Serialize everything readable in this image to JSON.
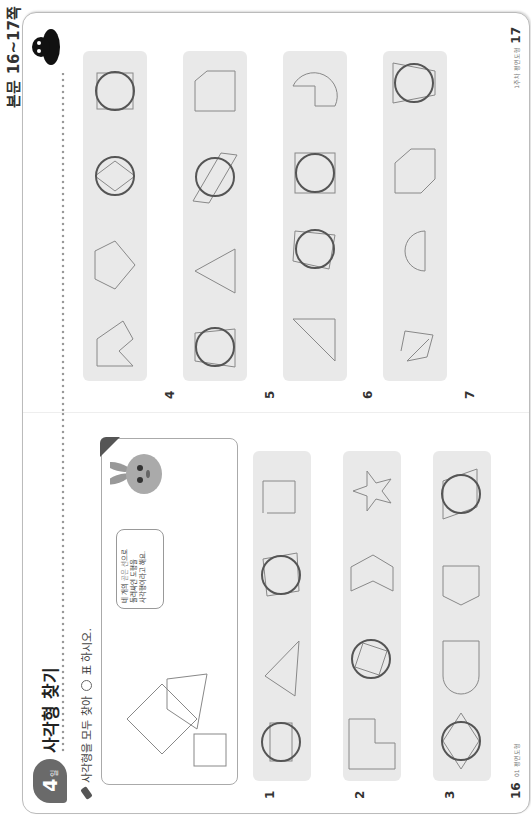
{
  "header": {
    "label": "본문 16~17쪽"
  },
  "left_page": {
    "day_badge": {
      "number": "4",
      "suffix": "일"
    },
    "title": "사각형 찾기",
    "instruction": {
      "before": "사각형을 모두 찾아",
      "after": "표 하시오."
    },
    "example": {
      "shapes": [
        "rhombus",
        "trapezoid",
        "square"
      ],
      "speech_bubble": {
        "line1_prefix": "네 개의 ",
        "line1_highlight": "곧은 선",
        "line1_suffix": "으로",
        "line2": "둘러싸인 도형을",
        "line3": "사각형이라고 해요."
      },
      "character": "bunny"
    },
    "problems": [
      {
        "number": "1",
        "shapes": [
          {
            "type": "rectangle",
            "circled": true
          },
          {
            "type": "triangle",
            "circled": false
          },
          {
            "type": "tilted-rectangle",
            "circled": true
          },
          {
            "type": "open-rectangle",
            "circled": false
          }
        ]
      },
      {
        "number": "2",
        "shapes": [
          {
            "type": "L-hexagon",
            "circled": false
          },
          {
            "type": "rotated-square",
            "circled": true
          },
          {
            "type": "chevron",
            "circled": false
          },
          {
            "type": "star",
            "circled": false
          }
        ]
      },
      {
        "number": "3",
        "shapes": [
          {
            "type": "rhombus",
            "circled": true
          },
          {
            "type": "semicircle",
            "circled": false
          },
          {
            "type": "pentagon",
            "circled": false
          },
          {
            "type": "parallelogram",
            "circled": true
          }
        ]
      }
    ],
    "page_number": "16",
    "page_tag": "01 평면도형"
  },
  "right_page": {
    "problems": [
      {
        "number": "4",
        "shapes": [
          {
            "type": "arrow-pentagon",
            "circled": false
          },
          {
            "type": "pentagon",
            "circled": false
          },
          {
            "type": "kite",
            "circled": true
          },
          {
            "type": "square",
            "circled": true
          }
        ]
      },
      {
        "number": "5",
        "shapes": [
          {
            "type": "trapezoid",
            "circled": true
          },
          {
            "type": "triangle",
            "circled": false
          },
          {
            "type": "parallelogram",
            "circled": true
          },
          {
            "type": "cut-rectangle",
            "circled": false
          }
        ]
      },
      {
        "number": "6",
        "shapes": [
          {
            "type": "right-triangle",
            "circled": false
          },
          {
            "type": "quadrilateral",
            "circled": true
          },
          {
            "type": "rectangle",
            "circled": true
          },
          {
            "type": "pacman-circle",
            "circled": false
          }
        ]
      },
      {
        "number": "7",
        "shapes": [
          {
            "type": "open-quadrilateral",
            "circled": false
          },
          {
            "type": "semicircle",
            "circled": false
          },
          {
            "type": "hexagon",
            "circled": false
          },
          {
            "type": "trapezoid",
            "circled": true
          }
        ]
      }
    ],
    "page_number": "17",
    "page_tag": "1주차 평면도형"
  },
  "colors": {
    "strip_bg": "#e9e9e9",
    "answer_circle": "#555555",
    "shape_stroke": "#888888",
    "badge": "#6a6a6a"
  }
}
